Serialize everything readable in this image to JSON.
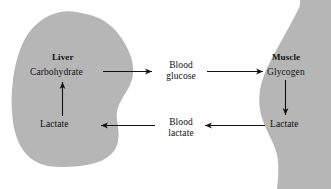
{
  "diagram": {
    "type": "biological-pathway-diagram",
    "background_color": "#ffffff",
    "organ_fill_color": "#b6b6b6",
    "text_color": "#111111",
    "organs": [
      {
        "key": "liver",
        "label": "Liver"
      },
      {
        "key": "muscle",
        "label": "Muscle"
      }
    ],
    "nodes": {
      "liver_carbohydrate": "Carbohydrate",
      "liver_lactate": "Lactate",
      "blood_glucose_line1": "Blood",
      "blood_glucose_line2": "glucose",
      "blood_lactate_line1": "Blood",
      "blood_lactate_line2": "lactate",
      "muscle_glycogen": "Glycogen",
      "muscle_lactate": "Lactate"
    },
    "arrows": [
      {
        "key": "carbohydrate-to-blood-glucose",
        "direction": "right"
      },
      {
        "key": "blood-glucose-to-glycogen",
        "direction": "right"
      },
      {
        "key": "glycogen-to-muscle-lactate",
        "direction": "down"
      },
      {
        "key": "muscle-lactate-to-blood-lactate",
        "direction": "left"
      },
      {
        "key": "blood-lactate-to-liver-lactate",
        "direction": "left"
      },
      {
        "key": "liver-lactate-to-carbohydrate",
        "direction": "up"
      }
    ]
  }
}
